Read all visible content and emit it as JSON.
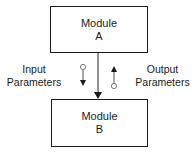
{
  "diagram": {
    "module_a": {
      "line1": "Module",
      "line2": "A"
    },
    "module_b": {
      "line1": "Module",
      "line2": "B"
    },
    "input_label": {
      "line1": "Input",
      "line2": "Parameters"
    },
    "output_label": {
      "line1": "Output",
      "line2": "Parameters"
    },
    "connection": {
      "from": "Module A",
      "to": "Module B",
      "type": "call"
    },
    "couples": [
      {
        "name": "Input Parameters",
        "direction": "down",
        "symbol": "data-couple"
      },
      {
        "name": "Output Parameters",
        "direction": "up",
        "symbol": "data-couple"
      }
    ],
    "colors": {
      "stroke": "#1a1a1a",
      "background": "#ffffff"
    }
  }
}
